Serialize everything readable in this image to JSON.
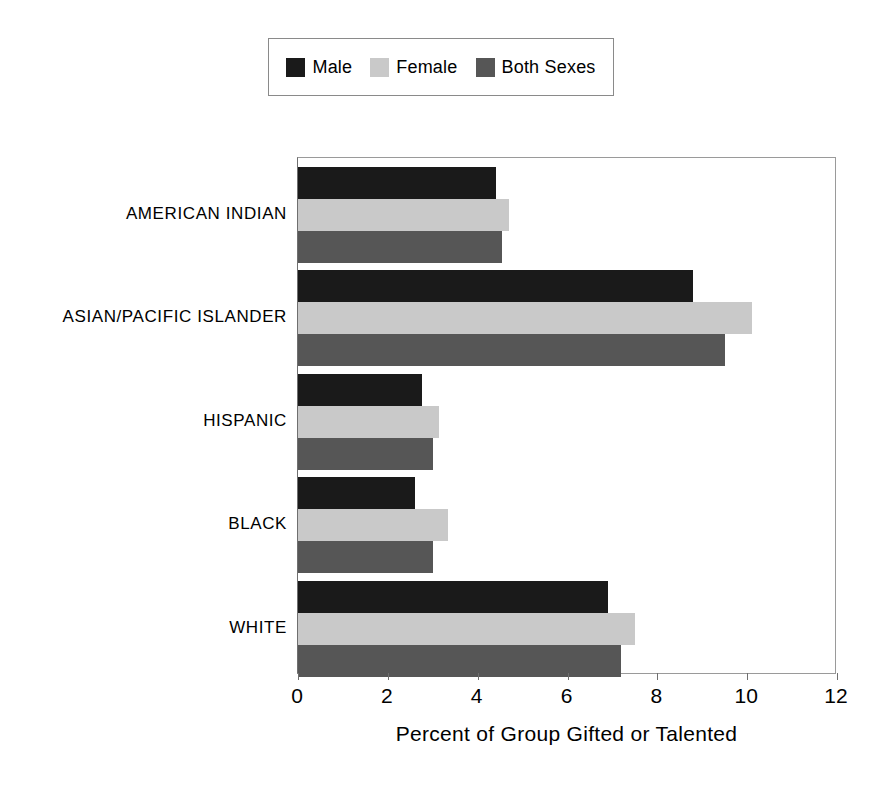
{
  "chart_data": {
    "type": "bar",
    "orientation": "horizontal",
    "title": "",
    "xlabel": "Percent of Group Gifted or Talented",
    "ylabel": "",
    "xlim": [
      0,
      12
    ],
    "xticks": [
      0,
      2,
      4,
      6,
      8,
      10,
      12
    ],
    "xticklabels": [
      "0",
      "2",
      "4",
      "6",
      "8",
      "10",
      "12"
    ],
    "grid": false,
    "legend_position": "top-center",
    "categories": [
      "AMERICAN INDIAN",
      "ASIAN/PACIFIC ISLANDER",
      "HISPANIC",
      "BLACK",
      "WHITE"
    ],
    "series": [
      {
        "name": "Male",
        "color": "#1a1a1a",
        "values": [
          4.4,
          8.8,
          2.75,
          2.6,
          6.9
        ]
      },
      {
        "name": "Female",
        "color": "#c9c9c9",
        "values": [
          4.7,
          10.1,
          3.15,
          3.35,
          7.5
        ]
      },
      {
        "name": "Both Sexes",
        "color": "#565656",
        "values": [
          4.55,
          9.5,
          3.0,
          3.0,
          7.2
        ]
      }
    ]
  },
  "legend": {
    "items": [
      {
        "label": "Male",
        "swatch": "#1a1a1a"
      },
      {
        "label": "Female",
        "swatch": "#c9c9c9"
      },
      {
        "label": "Both Sexes",
        "swatch": "#565656"
      }
    ]
  },
  "axis": {
    "x_title": "Percent of Group Gifted or Talented",
    "x_ticklabels": [
      "0",
      "2",
      "4",
      "6",
      "8",
      "10",
      "12"
    ]
  },
  "colors": {
    "male": "#1a1a1a",
    "female": "#c9c9c9",
    "both_sexes": "#565656",
    "frame": "#9a9a9a",
    "background": "#ffffff",
    "text": "#000000"
  }
}
